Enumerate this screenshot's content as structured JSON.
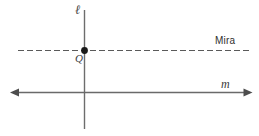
{
  "figure": {
    "background_color": "#ffffff",
    "stroke_color": "#6a6a6a",
    "dash_color": "#5a5a5a",
    "point_color": "#1a1a1a",
    "labels": {
      "vertical_line": "ℓ",
      "point": "Q",
      "horizontal_line": "m",
      "mirror_line": "Mira"
    },
    "elements": {
      "vertical_line_l": {
        "name": "vertical-line-l",
        "x1": 84.5,
        "y1": 10,
        "x2": 84.5,
        "y2": 129
      },
      "horizontal_line_m": {
        "name": "horizontal-line-m",
        "x1": 12,
        "y1": 92.5,
        "x2": 251,
        "y2": 92.5,
        "arrow_left": true,
        "arrow_right": true
      },
      "dashed_mirror_line": {
        "name": "dashed-mirror-line",
        "x1": 18,
        "y1": 50.5,
        "x2": 250,
        "y2": 50.5,
        "dash": "6 3"
      },
      "point_q": {
        "name": "point-q",
        "cx": 84.5,
        "cy": 50.5,
        "r": 3.4
      }
    }
  }
}
